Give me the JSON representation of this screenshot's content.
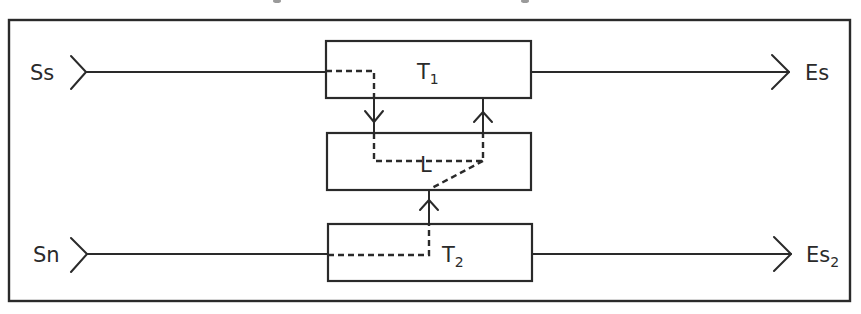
{
  "diagram": {
    "type": "block-diagram",
    "colors": {
      "stroke": "#2a2a2a",
      "background": "#ffffff"
    },
    "inputs": [
      {
        "id": "Ss",
        "label": "Ss",
        "subscript": ""
      },
      {
        "id": "Sn",
        "label": "Sn",
        "subscript": ""
      }
    ],
    "outputs": [
      {
        "id": "Es",
        "label": "Es",
        "subscript": ""
      },
      {
        "id": "Es2",
        "label": "Es",
        "subscript": "2"
      }
    ],
    "blocks": [
      {
        "id": "T1",
        "label": "T",
        "subscript": "1"
      },
      {
        "id": "L",
        "label": "L",
        "subscript": ""
      },
      {
        "id": "T2",
        "label": "T",
        "subscript": "2"
      }
    ],
    "connections": [
      {
        "from": "Ss",
        "to": "T1",
        "style": "solid"
      },
      {
        "from": "T1",
        "to": "Es",
        "style": "solid",
        "arrow": "right"
      },
      {
        "from": "Sn",
        "to": "T2",
        "style": "solid"
      },
      {
        "from": "T2",
        "to": "Es2",
        "style": "solid",
        "arrow": "right"
      },
      {
        "from": "T1",
        "to": "L",
        "style": "solid",
        "arrow": "down"
      },
      {
        "from": "L",
        "to": "T1",
        "style": "solid",
        "arrow": "up"
      },
      {
        "from": "T2",
        "to": "L",
        "style": "solid",
        "arrow": "up"
      },
      {
        "path": "Ss → T1 → L → T1",
        "style": "dashed"
      },
      {
        "path": "Sn → T2 → L → T1",
        "style": "dashed"
      }
    ]
  }
}
